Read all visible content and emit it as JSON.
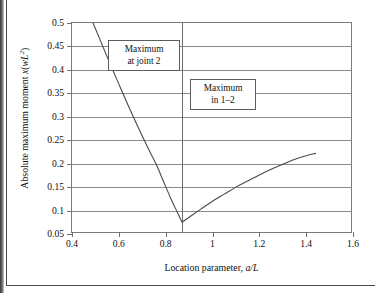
{
  "figure": {
    "background_color": "#ffffff",
    "frame_color": "#7a7a7a",
    "grid_color": "#8a8a8a",
    "curve_color": "#4a4a4a"
  },
  "axes": {
    "y_title_prefix": "Absolute maximum moment ",
    "y_title_var": "x",
    "y_title_open": "(",
    "y_title_w": "w",
    "y_title_L": "L",
    "y_title_exp": "2",
    "y_title_close": ")",
    "x_title_prefix": "Location parameter, ",
    "x_title_var": "a/L",
    "y_ticks": [
      "0.05",
      "0.1",
      "0.15",
      "0.2",
      "0.25",
      "0.3",
      "0.35",
      "0.4",
      "0.45",
      "0.5"
    ],
    "x_ticks": [
      "0.4",
      "0.6",
      "0.8",
      "1",
      "1.2",
      "1.4",
      "1.6"
    ]
  },
  "annotations": [
    {
      "name": "maximum-at-joint-2",
      "line1": "Maximum",
      "line2": "at joint 2"
    },
    {
      "name": "maximum-in-1-2",
      "line1": "Maximum",
      "line2": "in 1–2"
    }
  ],
  "chart_data": {
    "type": "line",
    "title": "",
    "xlabel": "Location parameter, a/L",
    "ylabel": "Absolute maximum moment x(wL2)",
    "xlim": [
      0.4,
      1.6
    ],
    "ylim": [
      0.05,
      0.5
    ],
    "xticks": [
      0.4,
      0.6,
      0.8,
      1.0,
      1.2,
      1.4,
      1.6
    ],
    "yticks": [
      0.05,
      0.1,
      0.15,
      0.2,
      0.25,
      0.3,
      0.35,
      0.4,
      0.45,
      0.5
    ],
    "grid": "horizontal",
    "legend": "none",
    "vertical_divider_x": 0.87,
    "series": [
      {
        "name": "Maximum at joint 2",
        "segment": "left",
        "x": [
          0.49,
          0.52,
          0.55,
          0.58,
          0.61,
          0.64,
          0.67,
          0.7,
          0.73,
          0.76,
          0.79,
          0.82,
          0.85,
          0.87
        ],
        "y": [
          0.5,
          0.464,
          0.428,
          0.393,
          0.358,
          0.324,
          0.291,
          0.259,
          0.228,
          0.198,
          0.163,
          0.128,
          0.096,
          0.075
        ]
      },
      {
        "name": "Maximum in 1–2",
        "segment": "right",
        "x": [
          0.87,
          0.95,
          1.0,
          1.05,
          1.1,
          1.15,
          1.2,
          1.25,
          1.3,
          1.35,
          1.4,
          1.44
        ],
        "y": [
          0.075,
          0.103,
          0.12,
          0.135,
          0.15,
          0.163,
          0.176,
          0.188,
          0.199,
          0.209,
          0.217,
          0.222
        ]
      }
    ],
    "annotations": [
      {
        "text": "Maximum at joint 2",
        "x": 0.66,
        "y": 0.43
      },
      {
        "text": "Maximum in 1–2",
        "x": 0.98,
        "y": 0.355
      }
    ]
  }
}
